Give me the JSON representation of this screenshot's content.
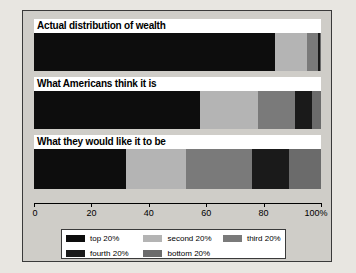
{
  "chart_data": {
    "type": "bar",
    "orientation": "horizontal",
    "stacked": true,
    "normalized_percent": true,
    "title": "",
    "xlabel": "",
    "ylabel": "",
    "xlim": [
      0,
      100
    ],
    "grid": false,
    "legend_position": "bottom",
    "categories": [
      "Actual distribution of wealth",
      "What Americans think it is",
      "What they would like it to be"
    ],
    "series": [
      {
        "name": "top 20%",
        "color": "#0d0d0d",
        "values": [
          84,
          58,
          32
        ]
      },
      {
        "name": "second 20%",
        "color": "#b4b4b4",
        "values": [
          11,
          20,
          21
        ]
      },
      {
        "name": "third 20%",
        "color": "#7a7a7a",
        "values": [
          4,
          13,
          23
        ]
      },
      {
        "name": "fourth 20%",
        "color": "#1a1a1a",
        "values": [
          0.5,
          6,
          13
        ]
      },
      {
        "name": "bottom 20%",
        "color": "#6b6b6b",
        "values": [
          0.5,
          3,
          11
        ]
      }
    ],
    "tick_values": [
      0,
      20,
      40,
      60,
      80,
      100
    ],
    "tick_labels": [
      "0",
      "20",
      "40",
      "60",
      "80",
      "100%"
    ],
    "legend_entries": [
      {
        "label": "top 20%",
        "color": "#0d0d0d"
      },
      {
        "label": "second 20%",
        "color": "#b4b4b4"
      },
      {
        "label": "third 20%",
        "color": "#7a7a7a"
      },
      {
        "label": "fourth 20%",
        "color": "#1a1a1a"
      },
      {
        "label": "bottom 20%",
        "color": "#6b6b6b"
      }
    ]
  },
  "figure": {
    "background_color": "#cfcdc8",
    "page_background_color": "#e8e6e1",
    "border_color": "#3a3a3a"
  }
}
